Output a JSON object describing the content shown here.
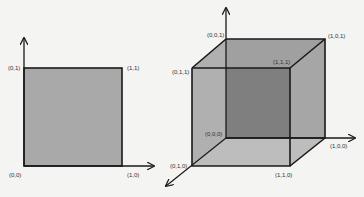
{
  "square": {
    "labels": {
      "v00": "(0,0)",
      "v01": "(0,1)",
      "v10": "(1,0)",
      "v11": "(1,1)"
    },
    "fill": "#a9a9a9"
  },
  "cube": {
    "labels": {
      "v000": "(0,0,0)",
      "v100": "(1,0,0)",
      "v010": "(0,1,0)",
      "v110": "(1,1,0)",
      "v001": "(0,0,1)",
      "v101": "(1,0,1)",
      "v011": "(0,1,1)",
      "v111": "(1,1,1)"
    },
    "colors": {
      "front": "#b3b3b3",
      "back": "#8c8c8c",
      "side": "#a3a3a3",
      "top": "#9e9e9e",
      "bottom": "#bcbcbc"
    }
  },
  "colors": {
    "background": "#f4f4f2",
    "stroke": "#1a1a1a"
  }
}
